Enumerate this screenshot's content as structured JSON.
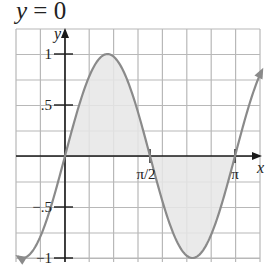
{
  "title": {
    "lhs": "y",
    "eq": "=",
    "rhs": "0"
  },
  "colors": {
    "grid": "#b8b8b8",
    "axis": "#1a1a1a",
    "curve": "#8a8a8a",
    "fill": "#e6e6e6",
    "background": "#ffffff"
  },
  "chart_data": {
    "type": "line",
    "title": "y = 0",
    "function": "y = sin(2x)",
    "xlabel": "x",
    "ylabel": "y",
    "xlim": [
      -0.87,
      3.64
    ],
    "ylim": [
      -1,
      1
    ],
    "x_ticks": [
      {
        "value": 1.5708,
        "label": "π/2"
      },
      {
        "value": 3.1416,
        "label": "π"
      }
    ],
    "y_ticks": [
      {
        "value": 1,
        "label": "1"
      },
      {
        "value": 0.5,
        "label": ".5"
      },
      {
        "value": -0.5,
        "label": "-.5"
      },
      {
        "value": -1,
        "label": "-1"
      }
    ],
    "series": [
      {
        "name": "sin(2x)",
        "x": [
          -0.87,
          -0.785,
          -0.5,
          -0.25,
          0,
          0.25,
          0.5,
          0.785,
          1.0,
          1.25,
          1.5708,
          1.75,
          2.0,
          2.356,
          2.6,
          2.9,
          3.1416,
          3.4,
          3.64
        ],
        "values": [
          -0.985,
          -1.0,
          -0.841,
          -0.479,
          0,
          0.479,
          0.841,
          1.0,
          0.909,
          0.598,
          0,
          -0.351,
          -0.757,
          -1.0,
          -0.883,
          -0.468,
          0,
          0.494,
          0.845
        ]
      }
    ],
    "shaded_regions": [
      {
        "from": 0,
        "to": 1.5708,
        "label": "area above x-axis"
      },
      {
        "from": 1.5708,
        "to": 3.1416,
        "label": "area below x-axis"
      }
    ],
    "grid": true
  }
}
